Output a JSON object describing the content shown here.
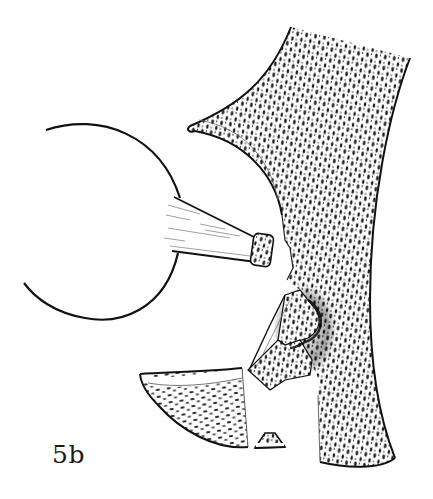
{
  "figure": {
    "label": "5b",
    "colors": {
      "ink": "#111111",
      "background": "#ffffff",
      "stipple": "#1a1a1a",
      "hatch": "#555555"
    },
    "parts": [
      "ball-head-outline",
      "ligament-stump",
      "upper-bone-shaft",
      "middle-fracture-fragment",
      "lower-left-fragment",
      "small-chip-fragment"
    ]
  }
}
